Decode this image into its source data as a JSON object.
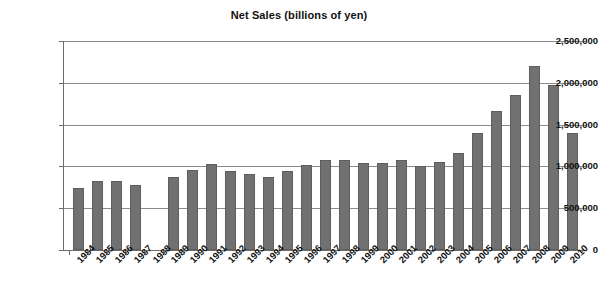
{
  "chart_data": {
    "type": "bar",
    "title": "Net Sales (billions of yen)",
    "xlabel": "",
    "ylabel": "",
    "ylim": [
      0,
      2500000
    ],
    "ytick_labels": [
      "2,500,000",
      "2,000,000",
      "1,500,000",
      "1,000,000",
      "500,000",
      "0"
    ],
    "ytick_values": [
      2500000,
      2000000,
      1500000,
      1000000,
      500000,
      0
    ],
    "grid": true,
    "legend": null,
    "bar_color": "#717171",
    "categories": [
      "1984",
      "1985",
      "1986",
      "1987",
      "1988",
      "1989",
      "1990",
      "1991",
      "1992",
      "1993",
      "1994",
      "1995",
      "1996",
      "1997",
      "1998",
      "1999",
      "2000",
      "2001",
      "2002",
      "2003",
      "2004",
      "2005",
      "2006",
      "2007",
      "2008",
      "2009",
      "2010"
    ],
    "values": [
      745000,
      830000,
      830000,
      780000,
      null,
      870000,
      960000,
      1025000,
      940000,
      905000,
      875000,
      940000,
      1020000,
      1075000,
      1080000,
      1045000,
      1040000,
      1075000,
      1000000,
      1055000,
      1155000,
      1400000,
      1660000,
      1850000,
      2200000,
      1970000,
      1395000
    ]
  }
}
